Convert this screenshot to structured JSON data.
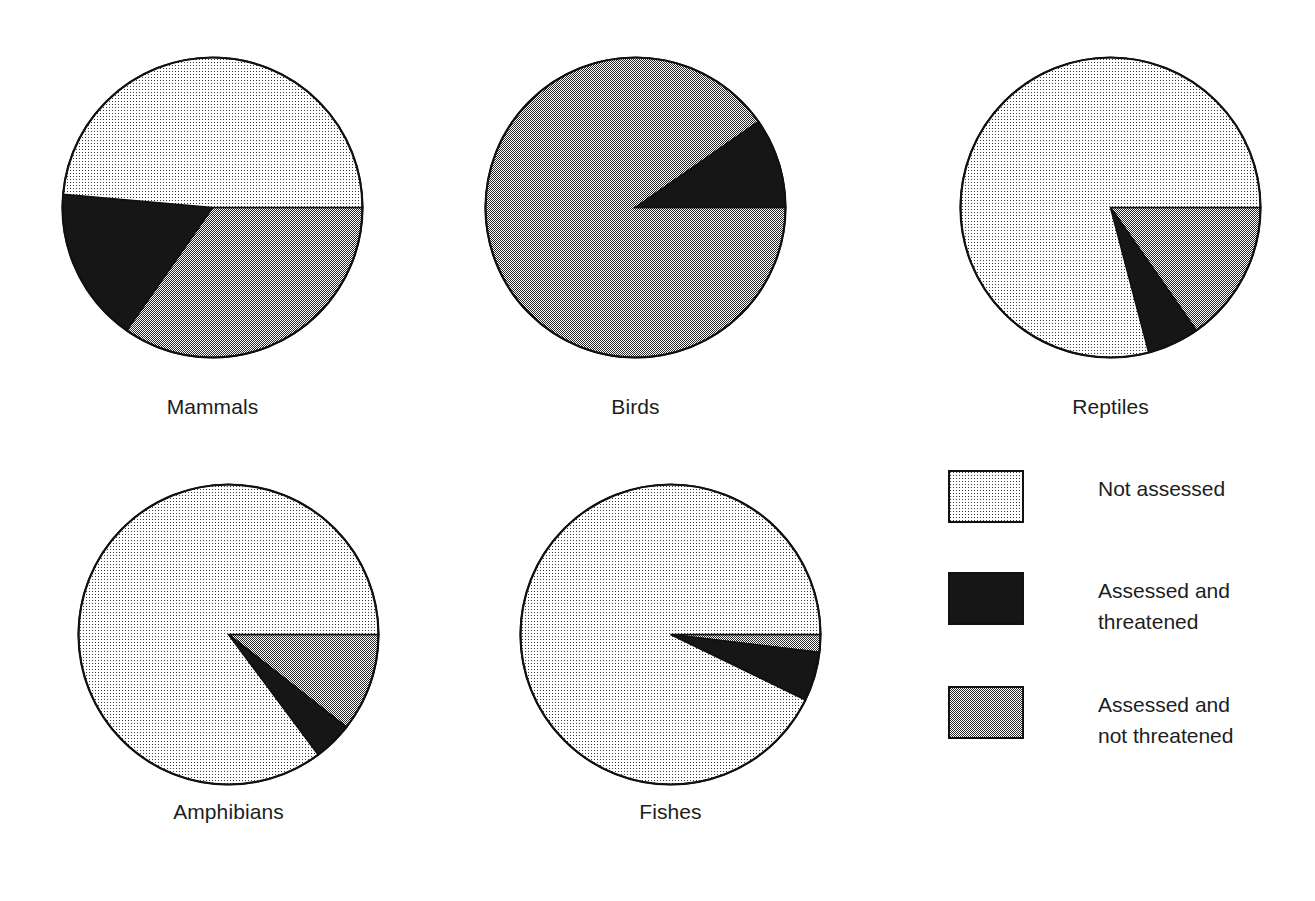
{
  "figure": {
    "title": "",
    "background": "#ffffff"
  },
  "chart_data": {
    "type": "pie",
    "title": "",
    "charts": [
      {
        "label": "Mammals",
        "categories": [
          "Assessed and not threatened",
          "Assessed and threatened",
          "Not assessed"
        ],
        "values": [
          34.7,
          16.7,
          48.6
        ],
        "start_angle_deg": 0,
        "direction": "clockwise"
      },
      {
        "label": "Birds",
        "categories": [
          "Assessed and not threatened",
          "Assessed and threatened",
          "Not assessed"
        ],
        "values": [
          90.3,
          9.7,
          0.0
        ],
        "start_angle_deg": 0,
        "direction": "clockwise"
      },
      {
        "label": "Reptiles",
        "categories": [
          "Assessed and not threatened",
          "Assessed and threatened",
          "Not assessed"
        ],
        "values": [
          15.3,
          5.6,
          79.1
        ],
        "start_angle_deg": 0,
        "direction": "clockwise"
      },
      {
        "label": "Amphibians",
        "categories": [
          "Assessed and not threatened",
          "Assessed and threatened",
          "Not assessed"
        ],
        "values": [
          10.6,
          4.2,
          85.2
        ],
        "start_angle_deg": 0,
        "direction": "clockwise"
      },
      {
        "label": "Fishes",
        "categories": [
          "Assessed and not threatened",
          "Assessed and threatened",
          "Not assessed"
        ],
        "values": [
          1.9,
          5.3,
          92.8
        ],
        "start_angle_deg": 0,
        "direction": "clockwise"
      }
    ],
    "legend": {
      "position": "bottom-right",
      "entries": [
        {
          "key": "not-assessed",
          "label": "Not assessed",
          "fill": "light-dither",
          "color": "#e9e9e9"
        },
        {
          "key": "assessed-threatened",
          "label": "Assessed and\nthreatened",
          "fill": "solid-black",
          "color": "#151515"
        },
        {
          "key": "assessed-not-threatened",
          "label": "Assessed and\nnot threatened",
          "fill": "mid-dither",
          "color": "#8a8a8a"
        }
      ]
    },
    "grid": false,
    "colors": {
      "outline": "#111111",
      "not_assessed": "#ededed",
      "assessed_threatened": "#151515",
      "assessed_not_threatened": "#888888"
    }
  }
}
